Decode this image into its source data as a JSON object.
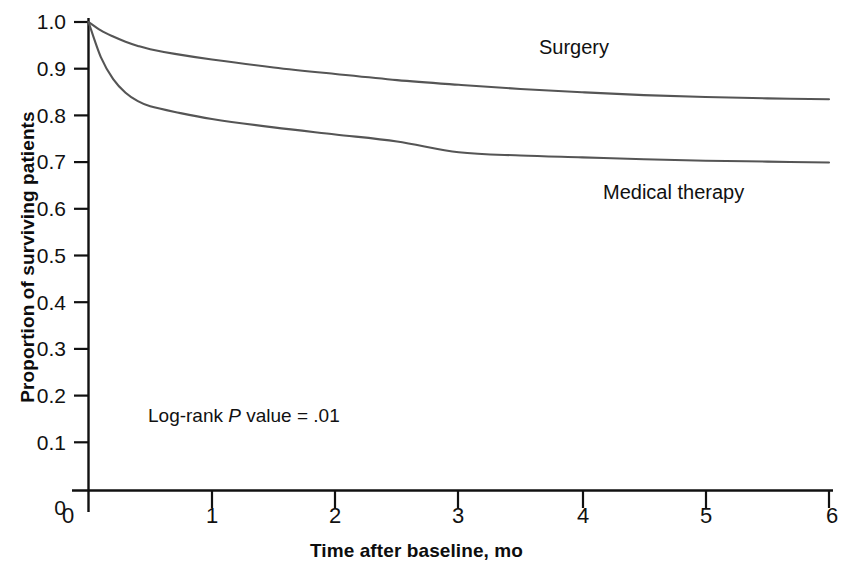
{
  "chart_data": {
    "type": "line",
    "title": "",
    "xlabel": "Time after baseline, mo",
    "ylabel": "Proportion of surviving patients",
    "xlim": [
      0,
      6
    ],
    "ylim": [
      0,
      1.0
    ],
    "grid": false,
    "legend_position": "inline-curve-labels",
    "x_ticks": [
      "0",
      "1",
      "2",
      "3",
      "4",
      "5",
      "6"
    ],
    "y_ticks": [
      "0",
      "0.1",
      "0.2",
      "0.3",
      "0.4",
      "0.5",
      "0.6",
      "0.7",
      "0.8",
      "0.9",
      "1.0"
    ],
    "x": [
      0,
      0.1,
      0.2,
      0.3,
      0.4,
      0.5,
      0.7,
      1,
      1.5,
      2,
      2.5,
      3,
      3.5,
      4,
      4.5,
      5,
      5.5,
      6
    ],
    "series": [
      {
        "name": "Surgery",
        "color": "#555555",
        "values": [
          1.0,
          0.982,
          0.969,
          0.958,
          0.949,
          0.942,
          0.932,
          0.92,
          0.903,
          0.889,
          0.876,
          0.866,
          0.857,
          0.85,
          0.844,
          0.84,
          0.837,
          0.835
        ]
      },
      {
        "name": "Medical therapy",
        "color": "#555555",
        "values": [
          1.0,
          0.925,
          0.878,
          0.849,
          0.831,
          0.82,
          0.808,
          0.793,
          0.775,
          0.76,
          0.745,
          0.722,
          0.715,
          0.711,
          0.707,
          0.704,
          0.702,
          0.7
        ]
      }
    ],
    "annotations": [
      {
        "name": "log-rank-p-value",
        "prefix": "Log-rank ",
        "italic": "P",
        "suffix": " value = .01",
        "text": "Log-rank P value = .01",
        "x": 0.5,
        "y": 0.185
      }
    ]
  },
  "axes": {
    "y_title": "Proportion of surviving patients",
    "x_title": "Time after baseline, mo",
    "y_tick_labels": [
      "1.0",
      "0.9",
      "0.8",
      "0.7",
      "0.6",
      "0.5",
      "0.4",
      "0.3",
      "0.2",
      "0.1",
      "0"
    ],
    "x_tick_labels": [
      "0",
      "1",
      "2",
      "3",
      "4",
      "5",
      "6"
    ]
  },
  "labels": {
    "surgery": "Surgery",
    "medical": "Medical therapy"
  },
  "annotation": {
    "prefix": "Log-rank ",
    "italic": "P",
    "suffix": " value = .01"
  }
}
